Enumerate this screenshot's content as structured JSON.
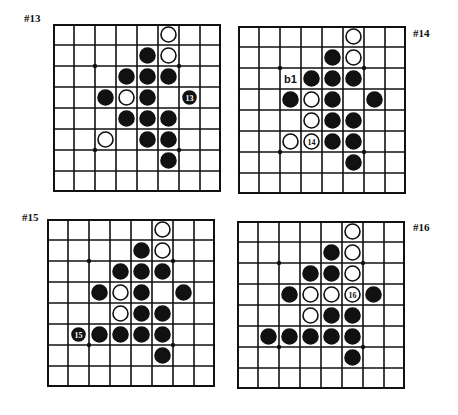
{
  "boards": [
    {
      "label": "#13",
      "pos": {
        "left": 53,
        "top": 24
      },
      "label_pos": {
        "left": 24,
        "top": 12
      },
      "stones": [
        {
          "r": 0,
          "c": 5,
          "color": "white"
        },
        {
          "r": 1,
          "c": 4,
          "color": "black"
        },
        {
          "r": 1,
          "c": 5,
          "color": "white"
        },
        {
          "r": 2,
          "c": 3,
          "color": "black"
        },
        {
          "r": 2,
          "c": 4,
          "color": "black"
        },
        {
          "r": 2,
          "c": 5,
          "color": "black"
        },
        {
          "r": 3,
          "c": 2,
          "color": "black"
        },
        {
          "r": 3,
          "c": 3,
          "color": "white"
        },
        {
          "r": 3,
          "c": 4,
          "color": "black"
        },
        {
          "r": 3,
          "c": 6,
          "color": "black",
          "text": "13",
          "small": true
        },
        {
          "r": 4,
          "c": 3,
          "color": "black"
        },
        {
          "r": 4,
          "c": 4,
          "color": "black"
        },
        {
          "r": 4,
          "c": 5,
          "color": "black"
        },
        {
          "r": 5,
          "c": 2,
          "color": "white"
        },
        {
          "r": 5,
          "c": 4,
          "color": "black"
        },
        {
          "r": 5,
          "c": 5,
          "color": "black"
        },
        {
          "r": 6,
          "c": 5,
          "color": "black"
        }
      ],
      "marks": []
    },
    {
      "label": "#14",
      "pos": {
        "left": 238,
        "top": 26
      },
      "label_pos": {
        "left": 413,
        "top": 27
      },
      "stones": [
        {
          "r": 0,
          "c": 5,
          "color": "white"
        },
        {
          "r": 1,
          "c": 4,
          "color": "black"
        },
        {
          "r": 1,
          "c": 5,
          "color": "white"
        },
        {
          "r": 2,
          "c": 3,
          "color": "black"
        },
        {
          "r": 2,
          "c": 4,
          "color": "black"
        },
        {
          "r": 2,
          "c": 5,
          "color": "black"
        },
        {
          "r": 3,
          "c": 2,
          "color": "black"
        },
        {
          "r": 3,
          "c": 3,
          "color": "white"
        },
        {
          "r": 3,
          "c": 4,
          "color": "black"
        },
        {
          "r": 3,
          "c": 6,
          "color": "black"
        },
        {
          "r": 4,
          "c": 3,
          "color": "white"
        },
        {
          "r": 4,
          "c": 4,
          "color": "black"
        },
        {
          "r": 4,
          "c": 5,
          "color": "black"
        },
        {
          "r": 5,
          "c": 2,
          "color": "white"
        },
        {
          "r": 5,
          "c": 3,
          "color": "white",
          "text": "14"
        },
        {
          "r": 5,
          "c": 4,
          "color": "black"
        },
        {
          "r": 5,
          "c": 5,
          "color": "black"
        },
        {
          "r": 6,
          "c": 5,
          "color": "black"
        }
      ],
      "marks": [
        {
          "r": 2,
          "c": 2,
          "text": "b1"
        }
      ]
    },
    {
      "label": "#15",
      "pos": {
        "left": 47,
        "top": 219
      },
      "label_pos": {
        "left": 22,
        "top": 211
      },
      "stones": [
        {
          "r": 0,
          "c": 5,
          "color": "white"
        },
        {
          "r": 1,
          "c": 4,
          "color": "black"
        },
        {
          "r": 1,
          "c": 5,
          "color": "white"
        },
        {
          "r": 2,
          "c": 3,
          "color": "black"
        },
        {
          "r": 2,
          "c": 4,
          "color": "black"
        },
        {
          "r": 2,
          "c": 5,
          "color": "black"
        },
        {
          "r": 3,
          "c": 2,
          "color": "black"
        },
        {
          "r": 3,
          "c": 3,
          "color": "white"
        },
        {
          "r": 3,
          "c": 4,
          "color": "black"
        },
        {
          "r": 3,
          "c": 6,
          "color": "black"
        },
        {
          "r": 4,
          "c": 3,
          "color": "white"
        },
        {
          "r": 4,
          "c": 4,
          "color": "black"
        },
        {
          "r": 4,
          "c": 5,
          "color": "black"
        },
        {
          "r": 5,
          "c": 1,
          "color": "black",
          "text": "15",
          "small": true
        },
        {
          "r": 5,
          "c": 2,
          "color": "black"
        },
        {
          "r": 5,
          "c": 3,
          "color": "black"
        },
        {
          "r": 5,
          "c": 4,
          "color": "black"
        },
        {
          "r": 5,
          "c": 5,
          "color": "black"
        },
        {
          "r": 6,
          "c": 5,
          "color": "black"
        }
      ],
      "marks": []
    },
    {
      "label": "#16",
      "pos": {
        "left": 237,
        "top": 221
      },
      "label_pos": {
        "left": 413,
        "top": 221
      },
      "stones": [
        {
          "r": 0,
          "c": 5,
          "color": "white"
        },
        {
          "r": 1,
          "c": 4,
          "color": "black"
        },
        {
          "r": 1,
          "c": 5,
          "color": "white"
        },
        {
          "r": 2,
          "c": 3,
          "color": "black"
        },
        {
          "r": 2,
          "c": 4,
          "color": "black"
        },
        {
          "r": 2,
          "c": 5,
          "color": "white"
        },
        {
          "r": 3,
          "c": 2,
          "color": "black"
        },
        {
          "r": 3,
          "c": 3,
          "color": "white"
        },
        {
          "r": 3,
          "c": 4,
          "color": "white"
        },
        {
          "r": 3,
          "c": 5,
          "color": "white",
          "text": "16"
        },
        {
          "r": 3,
          "c": 6,
          "color": "black"
        },
        {
          "r": 4,
          "c": 3,
          "color": "white"
        },
        {
          "r": 4,
          "c": 4,
          "color": "black"
        },
        {
          "r": 4,
          "c": 5,
          "color": "black"
        },
        {
          "r": 5,
          "c": 1,
          "color": "black"
        },
        {
          "r": 5,
          "c": 2,
          "color": "black"
        },
        {
          "r": 5,
          "c": 3,
          "color": "black"
        },
        {
          "r": 5,
          "c": 4,
          "color": "black"
        },
        {
          "r": 5,
          "c": 5,
          "color": "black"
        },
        {
          "r": 6,
          "c": 5,
          "color": "black"
        }
      ],
      "marks": []
    }
  ],
  "grid": {
    "size": 8,
    "star_points": [
      [
        2,
        2
      ],
      [
        2,
        6
      ],
      [
        6,
        2
      ],
      [
        6,
        6
      ]
    ]
  },
  "colors": {
    "black": "#111111",
    "white": "#ffffff",
    "line": "#111111"
  }
}
